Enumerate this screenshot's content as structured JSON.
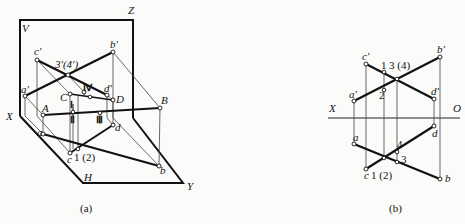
{
  "figure_a": {
    "caption": "(a)",
    "plane_labels": {
      "V": "V",
      "H": "H",
      "X": "X",
      "Y": "Y",
      "Z": "Z"
    },
    "point_labels": {
      "c_prime": "c′",
      "b_prime": "b′",
      "a_prime": "a′",
      "d_prime": "d′",
      "coincident_3_4_prime": "3′(4′)",
      "A": "A",
      "B": "B",
      "C": "C",
      "D": "D",
      "a": "a",
      "b": "b",
      "c": "c",
      "d": "d",
      "coincident_1_2": "1 (2)"
    },
    "roman_labels": {
      "I": "Ⅰ",
      "II": "Ⅱ",
      "III": "Ⅲ",
      "IV": "Ⅳ"
    }
  },
  "figure_b": {
    "caption": "(b)",
    "axis_labels": {
      "X": "X",
      "O": "O"
    },
    "point_labels": {
      "c_prime": "c′",
      "b_prime": "b′",
      "a_prime": "a′",
      "d_prime": "d′",
      "a": "a",
      "b": "b",
      "c": "c",
      "d": "d"
    },
    "number_labels": {
      "n1": "1",
      "n2": "2",
      "n3_4": "3 (4)",
      "n4": "4",
      "n3": "3",
      "n1_2": "1 (2)"
    }
  },
  "colors": {
    "ink": "#111111",
    "paper": "#fbfbf9",
    "construction": "#444444"
  }
}
